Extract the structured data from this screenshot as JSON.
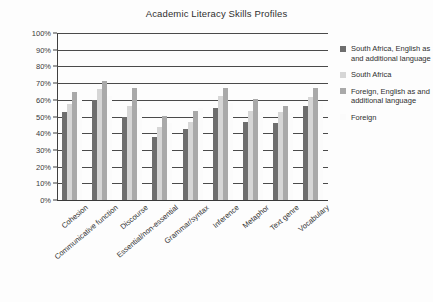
{
  "chart_data": {
    "type": "bar",
    "title": "Academic Literacy Skills Profiles",
    "xlabel": "",
    "ylabel": "",
    "ylim": [
      0,
      100
    ],
    "ytick_labels": [
      "100%",
      "90%",
      "80%",
      "70%",
      "60%",
      "50%",
      "40%",
      "30%",
      "20%",
      "10%",
      "0%"
    ],
    "ytick_values": [
      100,
      90,
      80,
      70,
      60,
      50,
      40,
      30,
      20,
      10,
      0
    ],
    "grid": true,
    "legend_position": "right",
    "categories": [
      "Cohesion",
      "Communicative function",
      "Discourse",
      "Essential/non-essential",
      "Grammar/syntax",
      "Inference",
      "Metaphor",
      "Text genre",
      "Vocabulary"
    ],
    "series": [
      {
        "name": "South Africa, English as and additional language",
        "color": "#6e6e6e",
        "values": [
          52.5,
          60,
          50,
          38,
          42.5,
          55,
          47,
          46,
          56
        ]
      },
      {
        "name": "South Africa",
        "color": "#d6d6d6",
        "values": [
          57.5,
          66.5,
          56.5,
          44,
          47,
          62,
          53.5,
          52.5,
          61.5
        ]
      },
      {
        "name": "Foreign, English as and additional language",
        "color": "#a9a9a9",
        "values": [
          64.5,
          71.5,
          67,
          50.5,
          53.5,
          67,
          60.5,
          56.5,
          67
        ]
      },
      {
        "name": "Foreign",
        "color": "#fbfbfb",
        "values": [
          60,
          62,
          55,
          46,
          55,
          58,
          53,
          52,
          58
        ]
      }
    ]
  },
  "legend": {
    "items": [
      {
        "label": "South Africa, English as and additional language",
        "color": "#6e6e6e"
      },
      {
        "label": "South Africa",
        "color": "#d6d6d6"
      },
      {
        "label": "Foreign, English as and additional language",
        "color": "#a9a9a9"
      },
      {
        "label": "Foreign",
        "color": "#fbfbfb"
      }
    ]
  }
}
